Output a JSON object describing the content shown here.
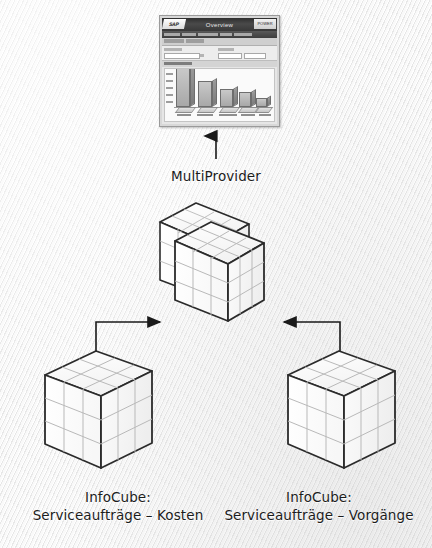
{
  "diagram": {
    "title_caption": "MultiProvider",
    "left_cube_caption": {
      "line1": "InfoCube:",
      "line2": "Serviceaufträge – Kosten"
    },
    "right_cube_caption": {
      "line1": "InfoCube:",
      "line2": "Serviceaufträge – Vorgänge"
    },
    "colors": {
      "background": "#f3f3f3",
      "cube_outline": "#2b2b2b",
      "cube_grid": "#b9b9b9",
      "cube_face": "#ffffff",
      "arrow": "#1a1a1a",
      "caption_text": "#1c1c1c"
    },
    "nodes": [
      {
        "name": "report-thumbnail",
        "label": "Overview report"
      },
      {
        "name": "multiprovider-cube",
        "label": "MultiProvider"
      },
      {
        "name": "infocube-left",
        "label": "InfoCube: Serviceaufträge – Kosten"
      },
      {
        "name": "infocube-right",
        "label": "InfoCube: Serviceaufträge – Vorgänge"
      }
    ],
    "arrows": [
      {
        "name": "arrow-multiprovider-to-report",
        "direction": "up"
      },
      {
        "name": "arrow-left-infocube-to-multiprovider",
        "direction": "right"
      },
      {
        "name": "arrow-right-infocube-to-multiprovider",
        "direction": "left"
      }
    ]
  },
  "thumbnail": {
    "logo_text": "SAP",
    "title": "Overview",
    "badge_text": "POWER",
    "chart": {
      "type": "bar",
      "title": "Overview",
      "categories": [
        "Kat 1",
        "Kat 2",
        "Kat 3",
        "Kat 4",
        "Kat 5"
      ],
      "values": [
        96,
        62,
        42,
        36,
        22
      ],
      "ylabel": "",
      "xlabel": "",
      "ylim": [
        0,
        100
      ],
      "grid": false,
      "legend": "none",
      "style": "3d-bar"
    }
  }
}
